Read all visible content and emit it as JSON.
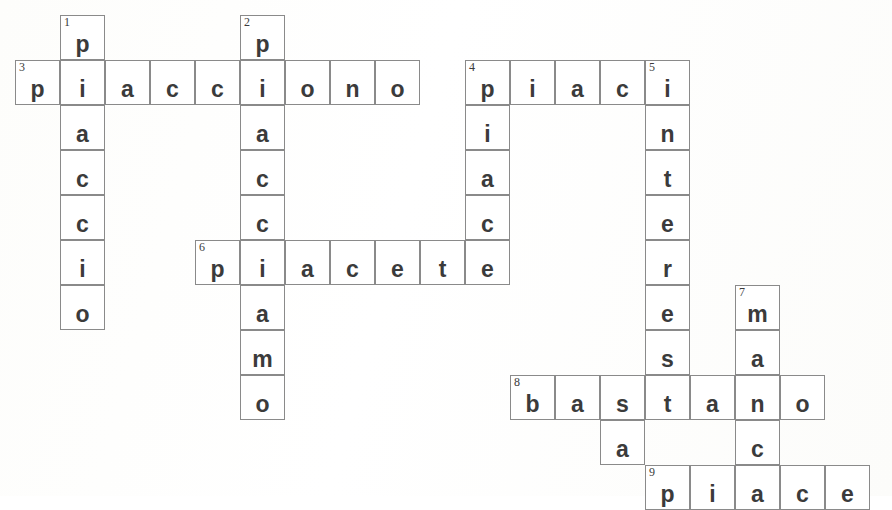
{
  "puzzle": {
    "title": "Italian verbs crossword grid",
    "cell_size": 45,
    "origin_x": 15,
    "origin_y": 15,
    "colors": {
      "border": "#8a8a8a",
      "letter": "#3b3b3b",
      "number": "#3b3b3b",
      "cell_background": "#ffffff",
      "page_background": "#fefefe"
    },
    "entries": [
      {
        "number": "1",
        "answer": "piaccio",
        "direction": "down",
        "col": 1,
        "row": 0,
        "length": 7
      },
      {
        "number": "2",
        "answer": "piacciamo",
        "direction": "down",
        "col": 5,
        "row": 0,
        "length": 9
      },
      {
        "number": "3",
        "answer": "piacciono",
        "direction": "across",
        "col": 0,
        "row": 1,
        "length": 9
      },
      {
        "number": "4",
        "answer": "piaci",
        "direction": "across",
        "col": 10,
        "row": 1,
        "length": 5
      },
      {
        "number": "4",
        "answer": "piace",
        "direction": "down",
        "col": 10,
        "row": 1,
        "length": 5
      },
      {
        "number": "5",
        "answer": "interessa",
        "direction": "down",
        "col": 13,
        "row": 1,
        "length": 9
      },
      {
        "number": "6",
        "answer": "piacete",
        "direction": "across",
        "col": 4,
        "row": 5,
        "length": 7
      },
      {
        "number": "7",
        "answer": "manca",
        "direction": "down",
        "col": 16,
        "row": 6,
        "length": 5
      },
      {
        "number": "8",
        "answer": "bastano",
        "direction": "across",
        "col": 11,
        "row": 8,
        "length": 7
      },
      {
        "number": "9",
        "answer": "piace",
        "direction": "across",
        "col": 14,
        "row": 10,
        "length": 5
      }
    ],
    "cells": [
      {
        "col": 1,
        "row": 0,
        "letter": "p",
        "number": "1"
      },
      {
        "col": 5,
        "row": 0,
        "letter": "p",
        "number": "2"
      },
      {
        "col": 0,
        "row": 1,
        "letter": "p",
        "number": "3"
      },
      {
        "col": 1,
        "row": 1,
        "letter": "i",
        "number": ""
      },
      {
        "col": 2,
        "row": 1,
        "letter": "a",
        "number": ""
      },
      {
        "col": 3,
        "row": 1,
        "letter": "c",
        "number": ""
      },
      {
        "col": 4,
        "row": 1,
        "letter": "c",
        "number": ""
      },
      {
        "col": 5,
        "row": 1,
        "letter": "i",
        "number": ""
      },
      {
        "col": 6,
        "row": 1,
        "letter": "o",
        "number": ""
      },
      {
        "col": 7,
        "row": 1,
        "letter": "n",
        "number": ""
      },
      {
        "col": 8,
        "row": 1,
        "letter": "o",
        "number": ""
      },
      {
        "col": 10,
        "row": 1,
        "letter": "p",
        "number": "4"
      },
      {
        "col": 11,
        "row": 1,
        "letter": "i",
        "number": ""
      },
      {
        "col": 12,
        "row": 1,
        "letter": "a",
        "number": ""
      },
      {
        "col": 13,
        "row": 1,
        "letter": "c",
        "number": ""
      },
      {
        "col": 14,
        "row": 1,
        "letter": "i",
        "number": "5"
      },
      {
        "col": 1,
        "row": 2,
        "letter": "a",
        "number": ""
      },
      {
        "col": 5,
        "row": 2,
        "letter": "a",
        "number": ""
      },
      {
        "col": 10,
        "row": 2,
        "letter": "i",
        "number": ""
      },
      {
        "col": 14,
        "row": 2,
        "letter": "n",
        "number": ""
      },
      {
        "col": 1,
        "row": 3,
        "letter": "c",
        "number": ""
      },
      {
        "col": 5,
        "row": 3,
        "letter": "c",
        "number": ""
      },
      {
        "col": 10,
        "row": 3,
        "letter": "a",
        "number": ""
      },
      {
        "col": 14,
        "row": 3,
        "letter": "t",
        "number": ""
      },
      {
        "col": 1,
        "row": 4,
        "letter": "c",
        "number": ""
      },
      {
        "col": 5,
        "row": 4,
        "letter": "c",
        "number": ""
      },
      {
        "col": 10,
        "row": 4,
        "letter": "c",
        "number": ""
      },
      {
        "col": 14,
        "row": 4,
        "letter": "e",
        "number": ""
      },
      {
        "col": 1,
        "row": 5,
        "letter": "i",
        "number": ""
      },
      {
        "col": 4,
        "row": 5,
        "letter": "p",
        "number": "6"
      },
      {
        "col": 5,
        "row": 5,
        "letter": "i",
        "number": ""
      },
      {
        "col": 6,
        "row": 5,
        "letter": "a",
        "number": ""
      },
      {
        "col": 7,
        "row": 5,
        "letter": "c",
        "number": ""
      },
      {
        "col": 8,
        "row": 5,
        "letter": "e",
        "number": ""
      },
      {
        "col": 9,
        "row": 5,
        "letter": "t",
        "number": ""
      },
      {
        "col": 10,
        "row": 5,
        "letter": "e",
        "number": ""
      },
      {
        "col": 14,
        "row": 5,
        "letter": "r",
        "number": ""
      },
      {
        "col": 1,
        "row": 6,
        "letter": "o",
        "number": ""
      },
      {
        "col": 5,
        "row": 6,
        "letter": "a",
        "number": ""
      },
      {
        "col": 14,
        "row": 6,
        "letter": "e",
        "number": ""
      },
      {
        "col": 16,
        "row": 6,
        "letter": "m",
        "number": "7"
      },
      {
        "col": 5,
        "row": 7,
        "letter": "m",
        "number": ""
      },
      {
        "col": 14,
        "row": 7,
        "letter": "s",
        "number": ""
      },
      {
        "col": 16,
        "row": 7,
        "letter": "a",
        "number": ""
      },
      {
        "col": 5,
        "row": 8,
        "letter": "o",
        "number": ""
      },
      {
        "col": 11,
        "row": 8,
        "letter": "b",
        "number": "8"
      },
      {
        "col": 12,
        "row": 8,
        "letter": "a",
        "number": ""
      },
      {
        "col": 13,
        "row": 8,
        "letter": "s",
        "number": ""
      },
      {
        "col": 14,
        "row": 8,
        "letter": "t",
        "number": ""
      },
      {
        "col": 15,
        "row": 8,
        "letter": "a",
        "number": ""
      },
      {
        "col": 16,
        "row": 8,
        "letter": "n",
        "number": ""
      },
      {
        "col": 17,
        "row": 8,
        "letter": "o",
        "number": ""
      },
      {
        "col": 13,
        "row": 9,
        "letter": "a",
        "number": ""
      },
      {
        "col": 16,
        "row": 9,
        "letter": "c",
        "number": ""
      },
      {
        "col": 14,
        "row": 10,
        "letter": "p",
        "number": "9"
      },
      {
        "col": 15,
        "row": 10,
        "letter": "i",
        "number": ""
      },
      {
        "col": 16,
        "row": 10,
        "letter": "a",
        "number": ""
      },
      {
        "col": 17,
        "row": 10,
        "letter": "c",
        "number": ""
      },
      {
        "col": 18,
        "row": 10,
        "letter": "e",
        "number": ""
      }
    ]
  }
}
